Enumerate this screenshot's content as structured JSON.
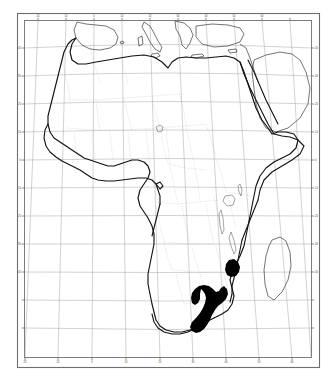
{
  "figure": {
    "kind": "distribution-map",
    "region": "Africa",
    "projection_note": "conic, converging meridians",
    "background_color": "#ffffff",
    "coastline_color": "#1a1a1a",
    "graticule_color": "#8a8a8a",
    "border_color": "#b5b5b5",
    "frame_color": "#555555",
    "distribution_fill": "#000000",
    "caption": ""
  },
  "frame": {
    "outer": {
      "x": 17,
      "y": 13,
      "width": 303,
      "height": 355
    },
    "inner": {
      "x": 24,
      "y": 20,
      "width": 288,
      "height": 338
    }
  },
  "graticule": {
    "meridian_count": 11,
    "parallel_count": 12,
    "longitude_labels": [
      "20",
      "10",
      "0",
      "10",
      "20",
      "30",
      "40",
      "50",
      "60"
    ],
    "latitude_labels": [
      "40",
      "30",
      "20",
      "10",
      "0",
      "10",
      "20",
      "30",
      "40"
    ],
    "top_ticks": [
      "20",
      "10",
      "0",
      "10",
      "20",
      "30",
      "40",
      "50",
      "60"
    ],
    "bottom_ticks": [
      "20",
      "10",
      "0",
      "10",
      "20",
      "30",
      "40",
      "50",
      "60"
    ],
    "left_ticks": [
      "40",
      "30",
      "20",
      "10",
      "0",
      "10",
      "20",
      "30",
      "40"
    ],
    "right_ticks": [
      "40",
      "30",
      "20",
      "10",
      "0",
      "10",
      "20",
      "30",
      "40"
    ]
  },
  "distribution": {
    "label": "shaded distribution range",
    "patch_count": 2,
    "patches": [
      {
        "name": "zimbabwe-mozambique-patch",
        "approx_center": [
          231,
          269
        ]
      },
      {
        "name": "south-africa-coastal-band",
        "approx_center": [
          214,
          308
        ]
      }
    ]
  },
  "features": {
    "landmass": "Africa",
    "adjacent_landmasses": [
      "Iberian Peninsula",
      "Italy",
      "Greece",
      "Turkey",
      "Arabian Peninsula",
      "Madagascar"
    ],
    "water_bodies": [
      "Mediterranean Sea",
      "Red Sea",
      "Gulf of Aden",
      "Gulf of Guinea",
      "Lake Victoria",
      "Lake Chad"
    ]
  }
}
